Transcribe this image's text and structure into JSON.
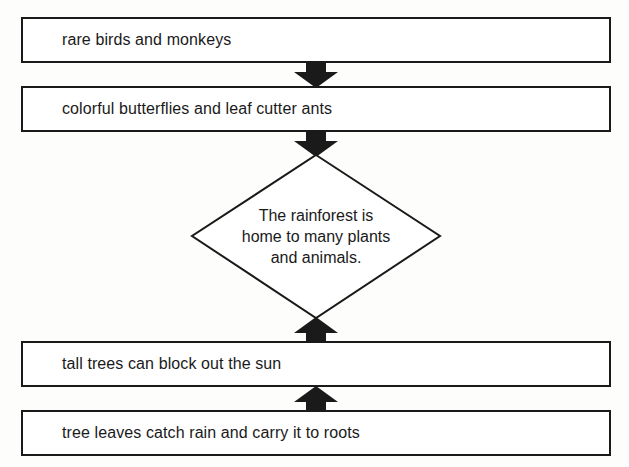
{
  "diagram": {
    "type": "flowchart",
    "top_boxes": [
      {
        "id": "detail-1",
        "text": "rare birds and monkeys"
      },
      {
        "id": "detail-2",
        "text": "colorful butterflies and leaf cutter ants"
      }
    ],
    "main_idea": {
      "text_lines": [
        "The rainforest is",
        "home to many plants",
        "and animals."
      ]
    },
    "bottom_boxes": [
      {
        "id": "detail-3",
        "text": "tall trees can block out the sun"
      },
      {
        "id": "detail-4",
        "text": "tree leaves catch rain and carry it to roots"
      }
    ],
    "arrows": [
      {
        "from": "detail-1",
        "to": "detail-2",
        "direction": "down"
      },
      {
        "from": "detail-2",
        "to": "main-idea",
        "direction": "down"
      },
      {
        "from": "detail-3",
        "to": "main-idea",
        "direction": "up"
      },
      {
        "from": "detail-4",
        "to": "detail-3",
        "direction": "up"
      }
    ],
    "colors": {
      "stroke": "#1a1a1a",
      "fill": "#ffffff",
      "background": "#fdfdfb"
    }
  }
}
